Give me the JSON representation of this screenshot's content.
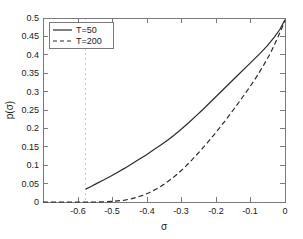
{
  "chart_data": {
    "type": "line",
    "title": "",
    "xlabel": "σ",
    "ylabel": "p(σ)",
    "xlim": [
      -0.68,
      0.0
    ],
    "ylim": [
      0.0,
      0.5
    ],
    "grid": false,
    "legend_position": "upper-left",
    "xticks": [
      -0.6,
      -0.5,
      -0.4,
      -0.3,
      -0.2,
      -0.1,
      0
    ],
    "xtick_labels": [
      "-0.6",
      "-0.5",
      "-0.4",
      "-0.3",
      "-0.2",
      "-0.1",
      "0"
    ],
    "yticks": [
      0,
      0.05,
      0.1,
      0.15,
      0.2,
      0.25,
      0.3,
      0.35,
      0.4,
      0.45,
      0.5
    ],
    "ytick_labels": [
      "0",
      "0.05",
      "0.1",
      "0.15",
      "0.2",
      "0.25",
      "0.3",
      "0.35",
      "0.4",
      "0.45",
      "0.5"
    ],
    "annotations": [
      {
        "name": "vertical-threshold-gridline",
        "type": "vline",
        "x": -0.56,
        "style": "dashed",
        "color": "#c8c8c8"
      }
    ],
    "series": [
      {
        "name": "T=50",
        "style": "solid",
        "color": "#2b2b2b",
        "x": [
          -0.56,
          -0.545,
          -0.53,
          -0.51,
          -0.49,
          -0.47,
          -0.45,
          -0.43,
          -0.41,
          -0.39,
          -0.37,
          -0.35,
          -0.33,
          -0.31,
          -0.29,
          -0.27,
          -0.25,
          -0.23,
          -0.21,
          -0.19,
          -0.17,
          -0.15,
          -0.13,
          -0.11,
          -0.09,
          -0.07,
          -0.05,
          -0.03,
          -0.015,
          0.0
        ],
        "y": [
          0.035,
          0.042,
          0.05,
          0.06,
          0.07,
          0.081,
          0.092,
          0.104,
          0.116,
          0.128,
          0.141,
          0.154,
          0.168,
          0.183,
          0.199,
          0.216,
          0.234,
          0.252,
          0.271,
          0.29,
          0.309,
          0.328,
          0.347,
          0.366,
          0.385,
          0.404,
          0.424,
          0.448,
          0.468,
          0.495
        ]
      },
      {
        "name": "T=200",
        "style": "dashed",
        "color": "#2b2b2b",
        "x": [
          -0.68,
          -0.6,
          -0.56,
          -0.53,
          -0.5,
          -0.48,
          -0.46,
          -0.45,
          -0.44,
          -0.43,
          -0.42,
          -0.41,
          -0.4,
          -0.38,
          -0.36,
          -0.34,
          -0.32,
          -0.3,
          -0.28,
          -0.26,
          -0.24,
          -0.22,
          -0.2,
          -0.18,
          -0.16,
          -0.14,
          -0.12,
          -0.1,
          -0.08,
          -0.06,
          -0.04,
          -0.02,
          0.0
        ],
        "y": [
          0.0,
          0.0,
          0.0,
          0.0,
          0.001,
          0.002,
          0.004,
          0.005,
          0.007,
          0.009,
          0.012,
          0.015,
          0.018,
          0.026,
          0.036,
          0.048,
          0.062,
          0.078,
          0.096,
          0.116,
          0.137,
          0.159,
          0.182,
          0.206,
          0.231,
          0.257,
          0.284,
          0.311,
          0.34,
          0.372,
          0.406,
          0.448,
          0.492
        ]
      }
    ]
  },
  "legend": {
    "entries": [
      {
        "label": "T=50",
        "style": "solid"
      },
      {
        "label": "T=200",
        "style": "dashed"
      }
    ]
  },
  "axis": {
    "x_label": "σ",
    "y_label": "p(σ)"
  }
}
